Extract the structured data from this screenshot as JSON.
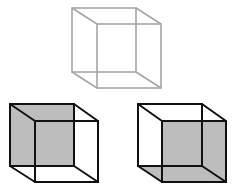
{
  "diagram": {
    "colors": {
      "background": "#ffffff",
      "outline_light": "#a6a6a6",
      "outline_dark": "#111111",
      "shade": "#bdbdbd"
    },
    "cubes": [
      {
        "id": "necker-cube-ambiguous",
        "stroke": "light",
        "back": {
          "x1": 72,
          "y1": 8,
          "x2": 136,
          "y2": 72
        },
        "front": {
          "x1": 97,
          "y1": 24,
          "x2": 161,
          "y2": 88
        },
        "shading": "none"
      },
      {
        "id": "cube-interpretation-left",
        "stroke": "dark",
        "back": {
          "x1": 10,
          "y1": 104,
          "x2": 74,
          "y2": 166
        },
        "front": {
          "x1": 35,
          "y1": 121,
          "x2": 98,
          "y2": 182
        },
        "shading": "back-face and left-face shaded"
      },
      {
        "id": "cube-interpretation-right",
        "stroke": "dark",
        "back": {
          "x1": 138,
          "y1": 104,
          "x2": 202,
          "y2": 166
        },
        "front": {
          "x1": 162,
          "y1": 121,
          "x2": 226,
          "y2": 182
        },
        "shading": "front-face and bottom-face shaded"
      }
    ]
  }
}
